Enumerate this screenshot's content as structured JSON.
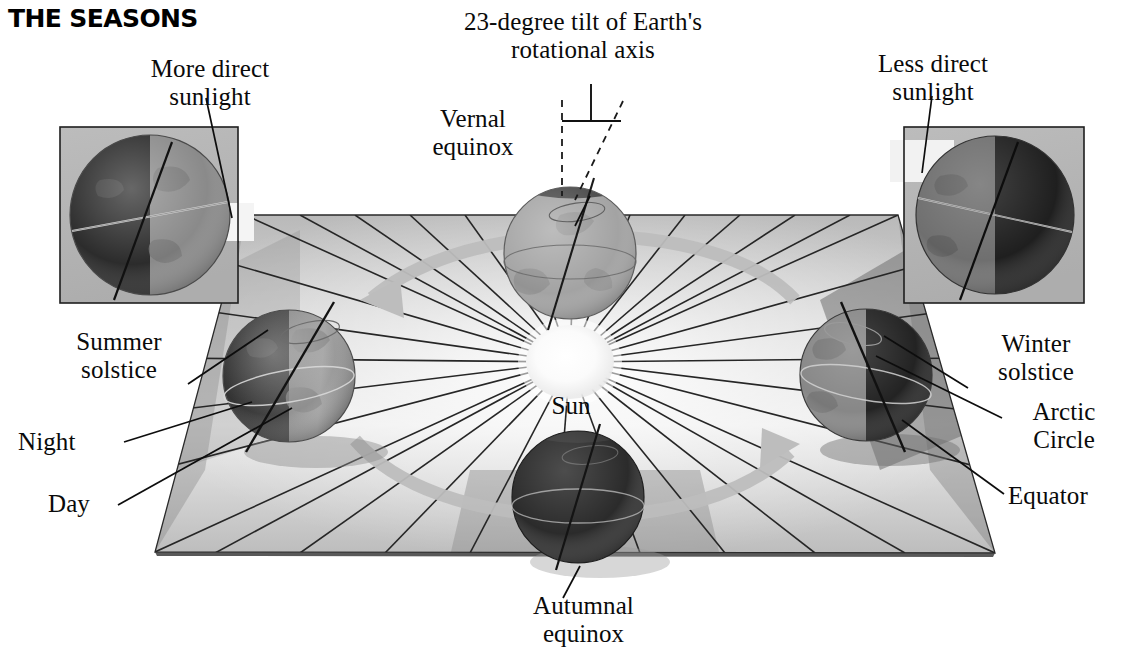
{
  "title": "THE SEASONS",
  "figure": {
    "kind": "astronomy-diagram",
    "center_body": "Sun"
  },
  "labels": {
    "title": "THE SEASONS",
    "more_direct": "More direct\nsunlight",
    "less_direct": "Less direct\nsunlight",
    "tilt": "23-degree tilt of Earth's\nrotational axis",
    "vernal": "Vernal\nequinox",
    "autumnal": "Autumnal\nequinox",
    "summer": "Summer\nsolstice",
    "winter": "Winter\nsolstice",
    "night": "Night",
    "day": "Day",
    "arctic": "Arctic\nCircle",
    "equator": "Equator",
    "sun": "Sun"
  },
  "positions": {
    "vernal_equinox": "top-center",
    "autumnal_equinox": "bottom-center",
    "summer_solstice": "left",
    "winter_solstice": "right"
  },
  "tilt_degrees": 23,
  "orbit": {
    "direction": "counterclockwise",
    "arrow_count": 2
  },
  "insets": {
    "left": {
      "caption": "More direct sunlight",
      "lit_side": "right",
      "dark_side": "left"
    },
    "right": {
      "caption": "Less direct sunlight",
      "lit_side": "left",
      "dark_side": "right"
    }
  },
  "colors": {
    "background": "#ffffff",
    "ink": "#0a0a0a",
    "plane_light": "#f2f2f2",
    "plane_mid": "#c9c9c9",
    "plane_dark": "#9d9d9d",
    "shadow": "#6d6d6d",
    "globe_day": "#9a9a9a",
    "globe_night": "#3a3a3a",
    "sun": "#fbfbfb",
    "inset_bg": "#b4b4b4",
    "orbit_arrow": "#bdbdbd"
  }
}
